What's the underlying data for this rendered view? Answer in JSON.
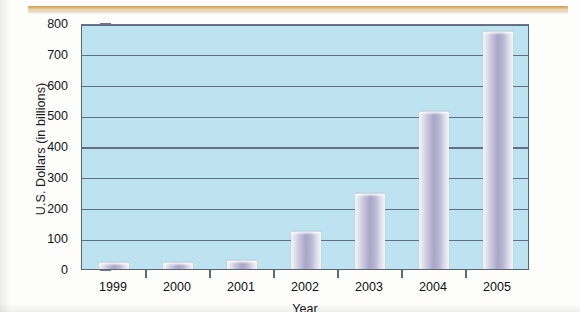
{
  "decor": {
    "top_rule_color": "#c99a4e"
  },
  "chart_data": {
    "type": "bar",
    "title": "",
    "xlabel": "Year",
    "ylabel": "U.S. Dollars (in billions)",
    "categories": [
      "1999",
      "2000",
      "2001",
      "2002",
      "2003",
      "2004",
      "2005"
    ],
    "values": [
      22,
      22,
      30,
      125,
      247,
      515,
      775
    ],
    "ytick_labels": [
      "800",
      "700",
      "600",
      "500",
      "400",
      "300",
      "200",
      "100",
      "0"
    ],
    "ytick_values": [
      800,
      700,
      600,
      500,
      400,
      300,
      200,
      100,
      0
    ],
    "ylim": [
      0,
      800
    ],
    "grid": true,
    "legend": "none",
    "colors": {
      "plot_background": "#bde3f0",
      "gridline": "#5d6780",
      "bar_mid": "#a9a5c6",
      "bar_edge": "#f4f4f8",
      "axis": "#5a6278",
      "text": "#111111"
    }
  }
}
